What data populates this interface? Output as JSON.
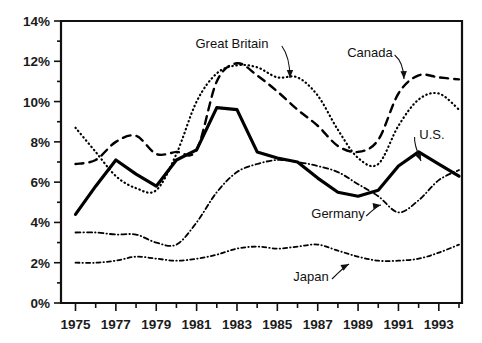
{
  "chart_data": {
    "type": "line",
    "title": "",
    "subtitle": "",
    "xlabel": "",
    "ylabel": "",
    "xlim": [
      1975,
      1994
    ],
    "ylim": [
      0,
      14
    ],
    "grid": false,
    "legend_position": "inline-annotations",
    "y_ticks": [
      "0%",
      "2%",
      "4%",
      "6%",
      "8%",
      "10%",
      "12%",
      "14%"
    ],
    "y_tick_values": [
      0,
      2,
      4,
      6,
      8,
      10,
      12,
      14
    ],
    "y_minor_ticks": [
      1,
      3,
      5,
      7,
      9,
      11,
      13
    ],
    "x_ticks": [
      "1975",
      "1977",
      "1979",
      "1981",
      "1983",
      "1985",
      "1987",
      "1989",
      "1991",
      "1993"
    ],
    "x_tick_values": [
      1975,
      1977,
      1979,
      1981,
      1983,
      1985,
      1987,
      1989,
      1991,
      1993
    ],
    "x_all_years": [
      1975,
      1976,
      1977,
      1978,
      1979,
      1980,
      1981,
      1982,
      1983,
      1984,
      1985,
      1986,
      1987,
      1988,
      1989,
      1990,
      1991,
      1992,
      1993,
      1994
    ],
    "value_unit": "percent",
    "series": [
      {
        "name": "U.S.",
        "style": "solid-bold",
        "color": "#000000",
        "x": [
          1975,
          1976,
          1977,
          1978,
          1979,
          1980,
          1981,
          1982,
          1983,
          1984,
          1985,
          1986,
          1987,
          1988,
          1989,
          1990,
          1991,
          1992,
          1993,
          1994
        ],
        "values": [
          4.4,
          5.8,
          7.1,
          6.4,
          5.8,
          7.1,
          7.6,
          9.7,
          9.6,
          7.5,
          7.2,
          7.0,
          6.2,
          5.5,
          5.3,
          5.6,
          6.8,
          7.5,
          6.9,
          6.3
        ]
      },
      {
        "name": "Great Britain",
        "style": "dotted",
        "color": "#000000",
        "x": [
          1975,
          1976,
          1977,
          1978,
          1979,
          1980,
          1981,
          1982,
          1983,
          1984,
          1985,
          1986,
          1987,
          1988,
          1989,
          1990,
          1991,
          1992,
          1993,
          1994
        ],
        "values": [
          8.7,
          7.5,
          6.3,
          5.7,
          5.6,
          7.4,
          10.0,
          11.4,
          11.8,
          11.7,
          11.2,
          11.2,
          10.3,
          8.6,
          7.2,
          6.9,
          8.8,
          10.1,
          10.4,
          9.6
        ]
      },
      {
        "name": "Canada",
        "style": "dashed",
        "color": "#000000",
        "x": [
          1975,
          1976,
          1977,
          1978,
          1979,
          1980,
          1981,
          1982,
          1983,
          1984,
          1985,
          1986,
          1987,
          1988,
          1989,
          1990,
          1991,
          1992,
          1993,
          1994
        ],
        "values": [
          6.9,
          7.1,
          8.0,
          8.3,
          7.4,
          7.5,
          7.6,
          11.0,
          11.9,
          11.3,
          10.5,
          9.6,
          8.8,
          7.8,
          7.5,
          8.1,
          10.4,
          11.3,
          11.2,
          11.1
        ]
      },
      {
        "name": "Germany",
        "style": "dash-dot",
        "color": "#000000",
        "x": [
          1975,
          1976,
          1977,
          1978,
          1979,
          1980,
          1981,
          1982,
          1983,
          1984,
          1985,
          1986,
          1987,
          1988,
          1989,
          1990,
          1991,
          1992,
          1993,
          1994
        ],
        "values": [
          3.5,
          3.5,
          3.4,
          3.4,
          3.0,
          2.9,
          4.0,
          5.5,
          6.5,
          6.9,
          7.1,
          7.0,
          6.8,
          6.5,
          5.9,
          5.3,
          4.5,
          5.1,
          6.1,
          6.6
        ]
      },
      {
        "name": "Japan",
        "style": "dash-dot-fine",
        "color": "#000000",
        "x": [
          1975,
          1976,
          1977,
          1978,
          1979,
          1980,
          1981,
          1982,
          1983,
          1984,
          1985,
          1986,
          1987,
          1988,
          1989,
          1990,
          1991,
          1992,
          1993,
          1994
        ],
        "values": [
          2.0,
          2.0,
          2.1,
          2.3,
          2.2,
          2.1,
          2.2,
          2.4,
          2.7,
          2.8,
          2.7,
          2.8,
          2.9,
          2.6,
          2.3,
          2.1,
          2.1,
          2.2,
          2.5,
          2.9
        ]
      }
    ],
    "annotations": [
      {
        "label": "Great Britain",
        "x": 232,
        "y": 48,
        "target_x": 290,
        "target_y": 78
      },
      {
        "label": "Canada",
        "x": 370,
        "y": 57,
        "target_x": 404,
        "target_y": 79
      },
      {
        "label": "U.S.",
        "x": 432,
        "y": 139,
        "target_x": 421,
        "target_y": 161
      },
      {
        "label": "Germany",
        "x": 338,
        "y": 218,
        "target_x": 381,
        "target_y": 205
      },
      {
        "label": "Japan",
        "x": 311,
        "y": 281,
        "target_x": 349,
        "target_y": 264
      }
    ]
  }
}
